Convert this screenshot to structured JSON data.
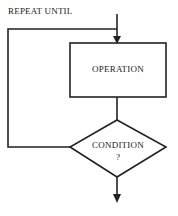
{
  "diagram": {
    "title": "REPEAT UNTIL",
    "operation_label": "OPERATION",
    "condition_label": "CONDITION",
    "condition_mark": "?"
  }
}
